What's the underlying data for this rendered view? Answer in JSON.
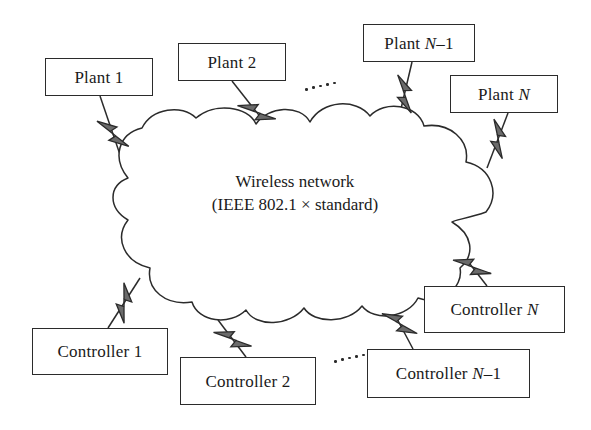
{
  "diagram": {
    "title_text": "Wireless network control system topology",
    "cloud": {
      "name": "wireless-network-cloud",
      "line1": "Wireless network",
      "line2": "(IEEE 802.1 × standard)",
      "fill": "#ffffff",
      "stroke": "#2b2b2b"
    },
    "colors": {
      "box_stroke": "#2b2b2b",
      "box_fill": "#ffffff",
      "text": "#1a1a1a",
      "link_line": "#2b2b2b",
      "bolt_fill": "#6b6b6b",
      "bolt_stroke": "#2b2b2b",
      "background": "#ffffff"
    },
    "plants": [
      {
        "id": "plant-1",
        "label_prefix": "Plant ",
        "label_italic": "",
        "label_suffix": "1",
        "x": 45,
        "y": 58,
        "w": 108,
        "h": 38,
        "font_size": 17
      },
      {
        "id": "plant-2",
        "label_prefix": "Plant ",
        "label_italic": "",
        "label_suffix": "2",
        "x": 178,
        "y": 43,
        "w": 108,
        "h": 38,
        "font_size": 17
      },
      {
        "id": "plant-n-1",
        "label_prefix": "Plant ",
        "label_italic": "N",
        "label_suffix": "–1",
        "x": 363,
        "y": 24,
        "w": 112,
        "h": 38,
        "font_size": 17
      },
      {
        "id": "plant-n",
        "label_prefix": "Plant ",
        "label_italic": "N",
        "label_suffix": "",
        "x": 450,
        "y": 75,
        "w": 108,
        "h": 38,
        "font_size": 17
      }
    ],
    "controllers": [
      {
        "id": "controller-1",
        "label_prefix": "Controller ",
        "label_italic": "",
        "label_suffix": "1",
        "x": 32,
        "y": 328,
        "w": 136,
        "h": 47,
        "font_size": 17
      },
      {
        "id": "controller-2",
        "label_prefix": "Controller ",
        "label_italic": "",
        "label_suffix": "2",
        "x": 180,
        "y": 357,
        "w": 136,
        "h": 48,
        "font_size": 17
      },
      {
        "id": "controller-n-1",
        "label_prefix": "Controller ",
        "label_italic": "N",
        "label_suffix": "–1",
        "x": 367,
        "y": 349,
        "w": 163,
        "h": 49,
        "font_size": 17
      },
      {
        "id": "controller-n",
        "label_prefix": "Controller ",
        "label_italic": "N",
        "label_suffix": "",
        "x": 424,
        "y": 286,
        "w": 141,
        "h": 47,
        "font_size": 17
      }
    ],
    "links": [
      {
        "id": "link-plant-1",
        "from": "plant-1",
        "x1": 100,
        "y1": 96,
        "x2": 128,
        "y2": 178,
        "bolt_t": 0.46
      },
      {
        "id": "link-plant-2",
        "from": "plant-2",
        "x1": 232,
        "y1": 81,
        "x2": 288,
        "y2": 152,
        "bolt_t": 0.44
      },
      {
        "id": "link-plant-n-1",
        "from": "plant-n-1",
        "x1": 412,
        "y1": 62,
        "x2": 396,
        "y2": 130,
        "bolt_t": 0.47
      },
      {
        "id": "link-plant-n",
        "from": "plant-n",
        "x1": 508,
        "y1": 113,
        "x2": 487,
        "y2": 168,
        "bolt_t": 0.47
      },
      {
        "id": "link-controller-1",
        "from": "controller-1",
        "x1": 108,
        "y1": 328,
        "x2": 140,
        "y2": 278,
        "bolt_t": 0.5
      },
      {
        "id": "link-controller-2",
        "from": "controller-2",
        "x1": 246,
        "y1": 357,
        "x2": 218,
        "y2": 320,
        "bolt_t": 0.48
      },
      {
        "id": "link-controller-n-1",
        "from": "controller-n-1",
        "x1": 413,
        "y1": 349,
        "x2": 385,
        "y2": 296,
        "bolt_t": 0.48
      },
      {
        "id": "link-controller-n",
        "from": "controller-n",
        "x1": 487,
        "y1": 286,
        "x2": 456,
        "y2": 246,
        "bolt_t": 0.48
      }
    ],
    "ellipses": [
      {
        "id": "ellipsis-plants",
        "x": 305,
        "y": 80,
        "count": 5,
        "dx": 7.0,
        "dy": -1.6
      },
      {
        "id": "ellipsis-controllers",
        "x": 334,
        "y": 352,
        "count": 5,
        "dx": 7.0,
        "dy": -1.6
      }
    ]
  }
}
